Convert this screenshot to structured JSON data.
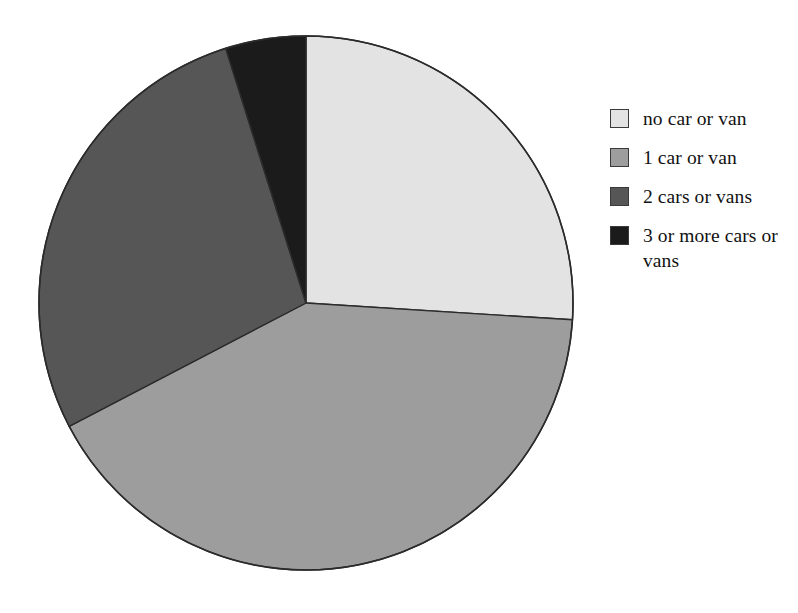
{
  "chart_data": {
    "type": "pie",
    "title": "",
    "subtitle": "",
    "xlabel": "",
    "ylabel": "",
    "legend_position": "right",
    "grid": false,
    "start_angle_deg": 0,
    "direction": "clockwise",
    "categories": [
      "no car or van",
      "1 car or van",
      "2 cars or vans",
      "3 or more cars or vans"
    ],
    "values": [
      26.0,
      41.4,
      27.8,
      4.8
    ],
    "units": "percent",
    "slices": [
      {
        "label": "no car or van",
        "value": 26.0,
        "color": "#e3e3e3",
        "start_angle_deg": 0.0,
        "end_angle_deg": 93.6
      },
      {
        "label": "1 car or van",
        "value": 41.4,
        "color": "#9d9d9d",
        "start_angle_deg": 93.6,
        "end_angle_deg": 242.5
      },
      {
        "label": "2 cars or vans",
        "value": 27.8,
        "color": "#565656",
        "start_angle_deg": 242.5,
        "end_angle_deg": 342.5
      },
      {
        "label": "3 or more cars or vans",
        "value": 4.8,
        "color": "#1b1b1b",
        "start_angle_deg": 342.5,
        "end_angle_deg": 360.0
      }
    ]
  },
  "figure": {
    "background_color": "#ffffff",
    "outline_color": "#2b2b2b",
    "center_x": 306,
    "center_y": 303,
    "radius": 267
  },
  "legend": {
    "items": [
      {
        "label": "no car or van",
        "color": "#e3e3e3"
      },
      {
        "label": "1 car or van",
        "color": "#9d9d9d"
      },
      {
        "label": "2 cars or vans",
        "color": "#565656"
      },
      {
        "label": "3 or more cars or vans",
        "color": "#1b1b1b"
      }
    ]
  }
}
